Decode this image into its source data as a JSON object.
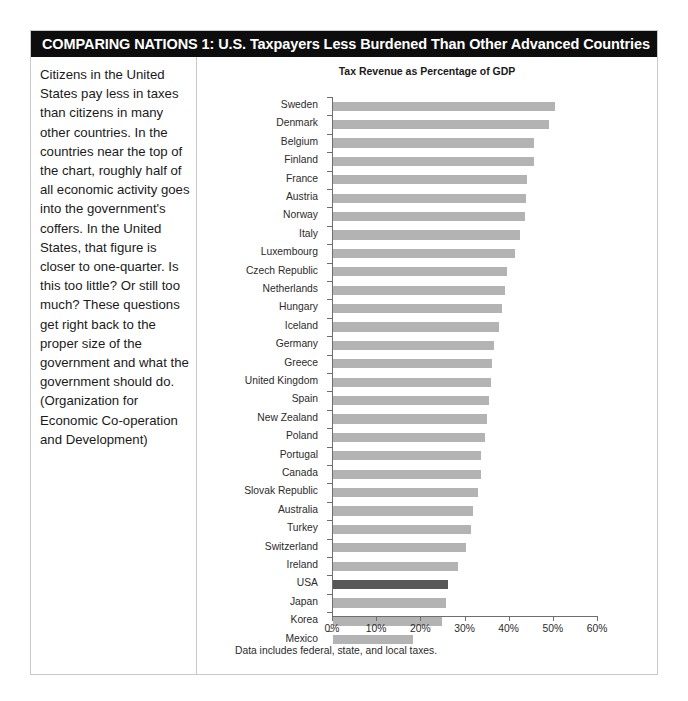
{
  "header": {
    "title": "COMPARING NATIONS 1: U.S. Taxpayers Less Burdened Than Other Advanced Countries",
    "background_color": "#0d0d0d",
    "text_color": "#ffffff"
  },
  "caption": {
    "text": "Citizens in the United States pay less in taxes than citizens in many other countries. In the countries near the top of the chart, roughly half of all economic activity goes into the government's coffers. In the United States, that figure is closer to one-quarter. Is this too little? Or still too much? These questions get right back to the proper size of the government and what the government should do. (Organization for Economic Co-operation and Development)"
  },
  "footnote": {
    "text": "Data includes federal, state, and local taxes."
  },
  "colors": {
    "bar": "#b3b3b3",
    "bar_highlight": "#575757",
    "axis": "#6e6e6e",
    "border": "#c9c9c9",
    "page_background": "#ffffff"
  },
  "chart_data": {
    "type": "bar",
    "orientation": "horizontal",
    "title": "Tax Revenue as Percentage of GDP",
    "xlabel": "",
    "ylabel": "",
    "xlim": [
      0,
      60
    ],
    "xticks": [
      0,
      10,
      20,
      30,
      40,
      50,
      60
    ],
    "xtick_labels": [
      "0%",
      "10%",
      "20%",
      "30%",
      "40%",
      "50%",
      "60%"
    ],
    "grid": false,
    "legend": null,
    "highlight_category": "USA",
    "units": "percent of GDP",
    "categories": [
      "Sweden",
      "Denmark",
      "Belgium",
      "Finland",
      "France",
      "Austria",
      "Norway",
      "Italy",
      "Luxembourg",
      "Czech Republic",
      "Netherlands",
      "Hungary",
      "Iceland",
      "Germany",
      "Greece",
      "United Kingdom",
      "Spain",
      "New Zealand",
      "Poland",
      "Portugal",
      "Canada",
      "Slovak Republic",
      "Australia",
      "Turkey",
      "Switzerland",
      "Ireland",
      "USA",
      "Japan",
      "Korea",
      "Mexico"
    ],
    "values": [
      50.2,
      49.0,
      45.6,
      45.4,
      44.0,
      43.6,
      43.4,
      42.3,
      41.2,
      39.4,
      39.0,
      38.2,
      37.6,
      36.4,
      36.0,
      35.8,
      35.4,
      34.8,
      34.4,
      33.6,
      33.4,
      32.8,
      31.6,
      31.2,
      30.2,
      28.4,
      26.0,
      25.6,
      24.6,
      18.2
    ]
  }
}
